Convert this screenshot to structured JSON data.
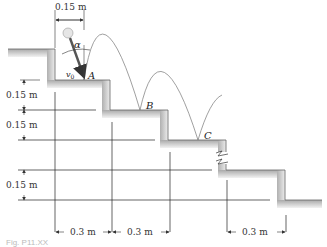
{
  "figure": {
    "dimensions": {
      "horizontal_offset_top": "0.15 m",
      "step_height_1": "0.15 m",
      "step_height_2": "0.15 m",
      "step_height_3": "0.15 m",
      "step_width_1": "0.3 m",
      "step_width_2": "0.3 m",
      "step_width_3": "0.3 m"
    },
    "points": {
      "a": "A",
      "b": "B",
      "c": "C"
    },
    "symbols": {
      "angle": "α",
      "velocity": "v",
      "velocity_sub": "0"
    },
    "caption": "Fig. P11.XX"
  }
}
